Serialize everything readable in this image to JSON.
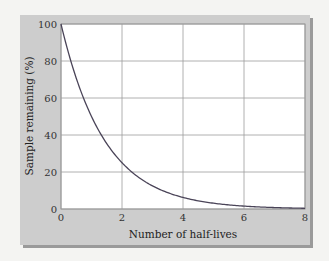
{
  "chart_data": {
    "type": "line",
    "title": "",
    "xlabel": "Number of half-lives",
    "ylabel": "Sample remaining (%)",
    "xlim": [
      0,
      8
    ],
    "ylim": [
      0,
      100
    ],
    "x_ticks": [
      0,
      2,
      4,
      6,
      8
    ],
    "y_ticks": [
      0,
      20,
      40,
      60,
      80,
      100
    ],
    "grid": true,
    "legend": null,
    "series": [
      {
        "name": "Sample remaining",
        "x": [
          0,
          0.5,
          1,
          1.5,
          2,
          2.5,
          3,
          3.5,
          4,
          4.5,
          5,
          5.5,
          6,
          6.5,
          7,
          7.5,
          8
        ],
        "values": [
          100,
          70.7,
          50,
          35.4,
          25,
          17.7,
          12.5,
          8.8,
          6.25,
          4.4,
          3.1,
          2.2,
          1.6,
          1.1,
          0.8,
          0.55,
          0.4
        ]
      }
    ],
    "colors": {
      "panel": "#cdcdcd",
      "plot_bg": "#ffffff",
      "grid": "#9c9c9c",
      "curve": "#4a4458"
    }
  }
}
